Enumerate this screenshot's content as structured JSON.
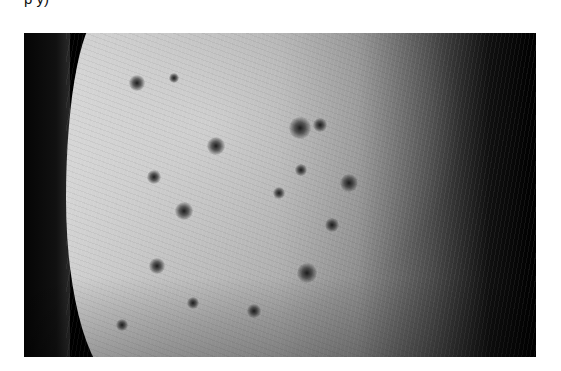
{
  "caption": {
    "text": "p                          y)",
    "note_visible": "clipped caption line at top edge"
  },
  "photo": {
    "description": "Grayscale clinical photograph of skin surface with scattered dark follicular papules",
    "colors": {
      "background": "#ffffff",
      "skin_light": "#cfcfcf",
      "skin_mid": "#a9a9a9",
      "shadow": "#000000"
    },
    "lesions": [
      {
        "x": 113,
        "y": 50,
        "size": 16
      },
      {
        "x": 192,
        "y": 113,
        "size": 18
      },
      {
        "x": 130,
        "y": 144,
        "size": 14
      },
      {
        "x": 160,
        "y": 178,
        "size": 18
      },
      {
        "x": 276,
        "y": 95,
        "size": 22
      },
      {
        "x": 296,
        "y": 92,
        "size": 14
      },
      {
        "x": 277,
        "y": 137,
        "size": 12
      },
      {
        "x": 325,
        "y": 150,
        "size": 18
      },
      {
        "x": 308,
        "y": 192,
        "size": 14
      },
      {
        "x": 133,
        "y": 233,
        "size": 16
      },
      {
        "x": 169,
        "y": 270,
        "size": 12
      },
      {
        "x": 283,
        "y": 240,
        "size": 20
      },
      {
        "x": 98,
        "y": 292,
        "size": 12
      },
      {
        "x": 230,
        "y": 278,
        "size": 14
      },
      {
        "x": 150,
        "y": 45,
        "size": 10
      },
      {
        "x": 255,
        "y": 160,
        "size": 12
      }
    ]
  }
}
